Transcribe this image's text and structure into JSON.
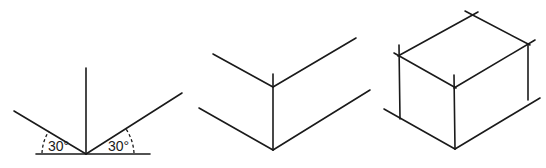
{
  "figures": [
    {
      "name": "angle-construction",
      "labels": {
        "left_angle": "30°",
        "right_angle": "30°"
      }
    },
    {
      "name": "corner-edges"
    },
    {
      "name": "isometric-box"
    }
  ],
  "colors": {
    "stroke": "#1a1a1a",
    "background": "#ffffff"
  }
}
